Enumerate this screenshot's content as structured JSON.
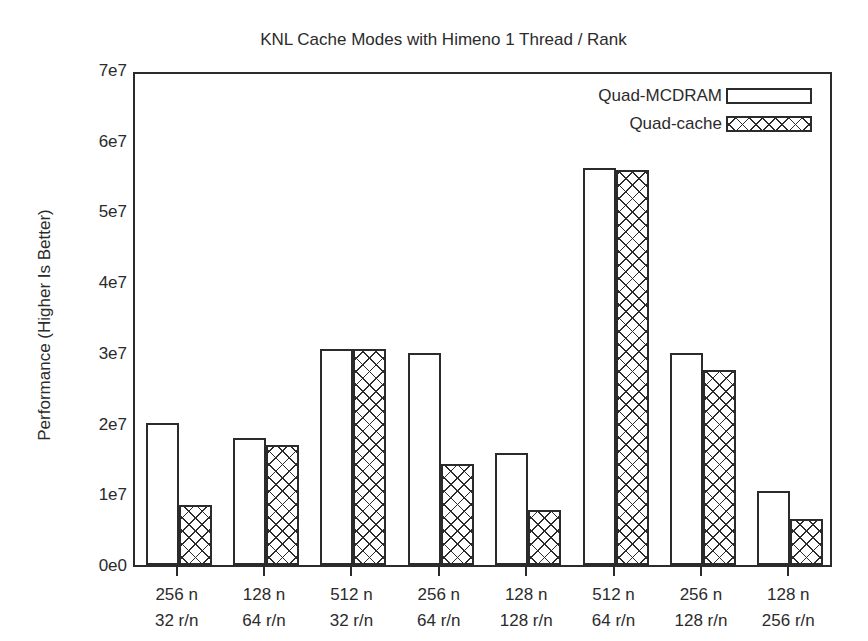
{
  "chart_data": {
    "type": "bar",
    "title": "KNL Cache Modes with Himeno 1 Thread / Rank",
    "subtitle": "Nodes - MPI Ranks / Node",
    "xlabel": "",
    "ylabel": "Performance (Higher Is Better)",
    "ylim": [
      0,
      70000000
    ],
    "ytick_values": [
      0,
      10000000,
      20000000,
      30000000,
      40000000,
      50000000,
      60000000,
      70000000
    ],
    "ytick_labels": [
      "0e0",
      "1e7",
      "2e7",
      "3e7",
      "4e7",
      "5e7",
      "6e7",
      "7e7"
    ],
    "grid": false,
    "legend_position": "top-right",
    "categories": [
      {
        "line1": "256 n",
        "line2": "32 r/n"
      },
      {
        "line1": "128 n",
        "line2": "64 r/n"
      },
      {
        "line1": "512 n",
        "line2": "32 r/n"
      },
      {
        "line1": "256 n",
        "line2": "64 r/n"
      },
      {
        "line1": "128 n",
        "line2": "128 r/n"
      },
      {
        "line1": "512 n",
        "line2": "64 r/n"
      },
      {
        "line1": "256 n",
        "line2": "128 r/n"
      },
      {
        "line1": "128 n",
        "line2": "256 r/n"
      }
    ],
    "series": [
      {
        "name": "Quad-MCDRAM",
        "fill": "solid-white",
        "values": [
          20100000,
          18000000,
          30500000,
          30000000,
          15900000,
          56200000,
          30000000,
          10500000
        ]
      },
      {
        "name": "Quad-cache",
        "fill": "crosshatch",
        "values": [
          8500000,
          17000000,
          30500000,
          14300000,
          7800000,
          55900000,
          27600000,
          6500000
        ]
      }
    ],
    "colors": {
      "axis": "#2b2b2b",
      "background": "#ffffff",
      "bar_outline": "#2b2b2b"
    }
  }
}
